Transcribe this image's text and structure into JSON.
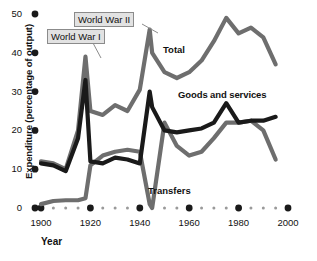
{
  "chart_data": {
    "type": "line",
    "title": "",
    "xlabel": "Year",
    "ylabel": "Expenditure (percentage of output)",
    "xlim": [
      1900,
      2000
    ],
    "ylim": [
      0,
      50
    ],
    "yticks": [
      0,
      10,
      20,
      30,
      40,
      50
    ],
    "xticks": [
      1900,
      1920,
      1940,
      1960,
      1980,
      2000
    ],
    "grid": false,
    "legend_position": "inline-annotations",
    "minor_tick_interval": 5,
    "x": [
      1900,
      1905,
      1910,
      1915,
      1918,
      1920,
      1925,
      1930,
      1935,
      1940,
      1944,
      1945,
      1950,
      1955,
      1960,
      1965,
      1970,
      1975,
      1980,
      1985,
      1990,
      1995
    ],
    "series": [
      {
        "name": "Total",
        "color": "#6e6e6e",
        "values": [
          12.0,
          11.5,
          10.0,
          20.0,
          39.0,
          25.0,
          24.0,
          26.5,
          25.0,
          30.5,
          46.0,
          40.0,
          35.0,
          33.5,
          35.0,
          38.0,
          43.0,
          49.0,
          45.0,
          46.5,
          44.0,
          37.0
        ]
      },
      {
        "name": "Goods and services",
        "color": "#1a1a1a",
        "values": [
          11.5,
          11.0,
          9.5,
          18.0,
          33.0,
          12.0,
          11.5,
          13.0,
          12.5,
          11.5,
          30.0,
          26.0,
          20.0,
          19.5,
          20.0,
          20.5,
          22.0,
          27.0,
          22.0,
          22.5,
          22.5,
          23.5
        ]
      },
      {
        "name": "Transfers",
        "color": "#6e6e6e",
        "values": [
          1.0,
          1.8,
          2.0,
          2.0,
          2.5,
          11.0,
          13.5,
          14.5,
          15.0,
          14.5,
          1.0,
          0.0,
          22.0,
          16.0,
          13.5,
          14.5,
          18.0,
          22.0,
          22.0,
          22.5,
          20.0,
          12.5
        ]
      }
    ],
    "annotations": [
      {
        "text": "World War I",
        "style": "callout-box",
        "points_to_year": 1918
      },
      {
        "text": "World War II",
        "style": "callout-box",
        "points_to_year": 1944
      },
      {
        "text": "Total",
        "style": "inline-label"
      },
      {
        "text": "Goods and services",
        "style": "inline-label"
      },
      {
        "text": "Transfers",
        "style": "inline-label"
      }
    ]
  },
  "axes": {
    "y_label": "Expenditure (percentage of output)",
    "x_label": "Year",
    "y_tick_labels": [
      "0",
      "10",
      "20",
      "30",
      "40",
      "50"
    ],
    "x_tick_labels": [
      "1900",
      "1920",
      "1940",
      "1960",
      "1980",
      "2000"
    ]
  },
  "labels": {
    "total": "Total",
    "goods": "Goods and services",
    "transfers": "Transfers",
    "ww1": "World War I",
    "ww2": "World War II"
  },
  "colors": {
    "total_line": "#6e6e6e",
    "goods_line": "#1a1a1a",
    "transfers_line": "#6e6e6e",
    "axis_dots": "#1a1a1a",
    "callout_fill": "#e2e2e2",
    "callout_border": "#8b8b8b"
  }
}
